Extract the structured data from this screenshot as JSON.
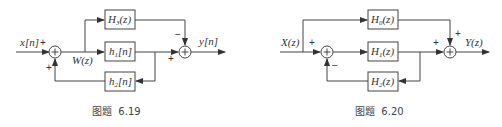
{
  "figures": [
    {
      "caption": "图题  6.19",
      "input_label": "x[n]",
      "output_label": "y[n]",
      "node_label": "W(z)",
      "blocks": [
        {
          "id": "top",
          "label": "H3(z)",
          "main": "H",
          "sub": "3",
          "arg": "(z)"
        },
        {
          "id": "middle",
          "label": "h1[n]",
          "main": "h",
          "sub": "1",
          "arg": "[n]"
        },
        {
          "id": "feedback",
          "label": "h2[n]",
          "main": "h",
          "sub": "2",
          "arg": "[n]"
        }
      ],
      "signs": {
        "sum1_input": "+",
        "sum1_feedback": "+",
        "sum2_top": "−",
        "sum2_left": "+"
      }
    },
    {
      "caption": "图题  6.20",
      "input_label": "X(z)",
      "output_label": "Y(z)",
      "blocks": [
        {
          "id": "top",
          "label": "H0(z)",
          "main": "H",
          "sub": "0",
          "arg": "(z)"
        },
        {
          "id": "middle",
          "label": "H1(z)",
          "main": "H",
          "sub": "1",
          "arg": "(z)"
        },
        {
          "id": "feedback",
          "label": "H2(z)",
          "main": "H",
          "sub": "2",
          "arg": "(z)"
        }
      ],
      "signs": {
        "sum1_input": "+",
        "sum1_feedback": "−",
        "sum2_top": "+",
        "sum2_left": "+"
      }
    }
  ]
}
